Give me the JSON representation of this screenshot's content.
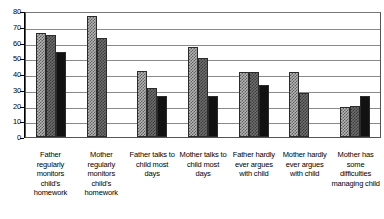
{
  "chart_data": {
    "type": "bar",
    "title": "",
    "subtitle": "",
    "xlabel": "",
    "ylabel": "",
    "ylim": [
      0,
      80
    ],
    "ytick_step": 10,
    "yticks": [
      0,
      10,
      20,
      30,
      40,
      50,
      60,
      70,
      80
    ],
    "ytick_labels": [
      "0",
      "10",
      "20",
      "30",
      "40",
      "50",
      "60",
      "70",
      "80"
    ],
    "grid": true,
    "grid_axis": "y",
    "legend": false,
    "legend_position": "none",
    "categories": [
      "Father regularly monitors child's homework",
      "Mother regularly monitors child's homework",
      "Father talks to child most days",
      "Mother talks to child most days",
      "Father hardly ever argues with child",
      "Mother hardly ever argues with child",
      "Mother has some difficulties managing child"
    ],
    "series": [
      {
        "name": "series-1",
        "pattern": "light-checkered",
        "color": "#b5b5b5",
        "values": [
          66,
          77,
          42,
          57,
          41,
          41,
          19
        ]
      },
      {
        "name": "series-2",
        "pattern": "dark-checkered",
        "color": "#6e6e6e",
        "values": [
          65,
          63,
          31,
          50,
          41,
          28,
          20
        ]
      },
      {
        "name": "series-3",
        "pattern": "solid",
        "color": "#121212",
        "values": [
          54,
          0,
          26,
          26,
          33,
          0,
          26
        ]
      }
    ]
  }
}
